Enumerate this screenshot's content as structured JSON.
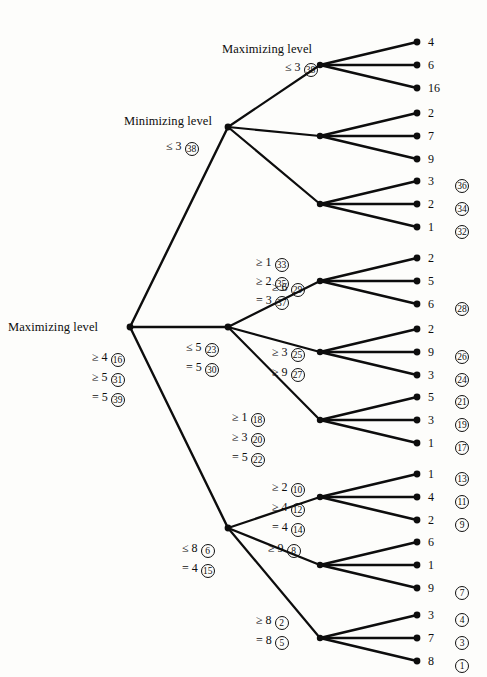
{
  "diagram": {
    "type": "alpha-beta-game-tree",
    "title": "",
    "level_labels": [
      {
        "text": "Maximizing level",
        "x": 222,
        "y": 49,
        "for_node": "root"
      },
      {
        "text": "Minimizing level",
        "x": 124,
        "y": 121,
        "for_node": "n-0"
      },
      {
        "text": "Maximizing level",
        "x": 217,
        "y": 51,
        "for_node": "n-0-0"
      }
    ],
    "root_label": "Maximizing level",
    "min_label": "Minimizing level",
    "max_label": "Maximizing level",
    "geometry": {
      "root_x": 130,
      "root_y": 327,
      "depth1_x": 228,
      "depth2_x": 320,
      "leaf_x": 417,
      "depth1_y": [
        127,
        327,
        528
      ],
      "depth2_y": [
        65,
        136,
        204,
        281,
        352,
        420,
        497,
        565,
        638
      ],
      "leaf_y": [
        42,
        65,
        88,
        113,
        136,
        159,
        181,
        204,
        227,
        258,
        281,
        304,
        329,
        352,
        375,
        397,
        420,
        443,
        474,
        497,
        520,
        542,
        565,
        588,
        615,
        638,
        661
      ]
    },
    "leaves": [
      {
        "value": "4",
        "order": "",
        "y": 42
      },
      {
        "value": "6",
        "order": "",
        "y": 65
      },
      {
        "value": "16",
        "order": "",
        "y": 88
      },
      {
        "value": "2",
        "order": "",
        "y": 113
      },
      {
        "value": "7",
        "order": "",
        "y": 136
      },
      {
        "value": "9",
        "order": "",
        "y": 159
      },
      {
        "value": "3",
        "order": "36",
        "y": 181
      },
      {
        "value": "2",
        "order": "34",
        "y": 204
      },
      {
        "value": "1",
        "order": "32",
        "y": 227
      },
      {
        "value": "2",
        "order": "",
        "y": 258
      },
      {
        "value": "5",
        "order": "",
        "y": 281
      },
      {
        "value": "6",
        "order": "28",
        "y": 304
      },
      {
        "value": "2",
        "order": "",
        "y": 329
      },
      {
        "value": "9",
        "order": "26",
        "y": 352
      },
      {
        "value": "3",
        "order": "24",
        "y": 375
      },
      {
        "value": "5",
        "order": "21",
        "y": 397
      },
      {
        "value": "3",
        "order": "19",
        "y": 420
      },
      {
        "value": "1",
        "order": "17",
        "y": 443
      },
      {
        "value": "1",
        "order": "13",
        "y": 474
      },
      {
        "value": "4",
        "order": "11",
        "y": 497
      },
      {
        "value": "2",
        "order": "9",
        "y": 520
      },
      {
        "value": "6",
        "order": "",
        "y": 542
      },
      {
        "value": "1",
        "order": "",
        "y": 565
      },
      {
        "value": "9",
        "order": "7",
        "y": 588
      },
      {
        "value": "3",
        "order": "4",
        "y": 615
      },
      {
        "value": "7",
        "order": "3",
        "y": 638
      },
      {
        "value": "8",
        "order": "1",
        "y": 661
      }
    ],
    "annotations": [
      {
        "id": "a-38b",
        "rel": "≤ 3",
        "value": "",
        "order": "38",
        "x": 285,
        "y": 67,
        "node": "n-0-0"
      },
      {
        "id": "a-38a",
        "rel": "≤ 3",
        "value": "",
        "order": "38",
        "x": 166,
        "y": 146,
        "node": "n-0"
      },
      {
        "id": "a-33",
        "rel": "≥ 1",
        "value": "",
        "order": "33",
        "x": 256,
        "y": 262,
        "node": "n-0-2"
      },
      {
        "id": "a-35",
        "rel": "≥ 2",
        "value": "",
        "order": "35",
        "x": 256,
        "y": 281,
        "node": "n-0-2"
      },
      {
        "id": "a-37",
        "rel": "= 3",
        "value": "",
        "order": "37",
        "x": 256,
        "y": 300,
        "node": "n-0-2"
      },
      {
        "id": "a-29",
        "rel": "≥ 6",
        "value": "",
        "order": "29",
        "x": 272,
        "y": 287,
        "node": "n-1-0"
      },
      {
        "id": "a-16",
        "rel": "≥ 4",
        "value": "",
        "order": "16",
        "x": 92,
        "y": 357,
        "node": "root"
      },
      {
        "id": "a-31",
        "rel": "≥ 5",
        "value": "",
        "order": "31",
        "x": 92,
        "y": 377,
        "node": "root"
      },
      {
        "id": "a-39",
        "rel": "= 5",
        "value": "",
        "order": "39",
        "x": 92,
        "y": 397,
        "node": "root"
      },
      {
        "id": "a-23",
        "rel": "≤ 5",
        "value": "",
        "order": "23",
        "x": 186,
        "y": 347,
        "node": "n-1"
      },
      {
        "id": "a-30",
        "rel": "= 5",
        "value": "",
        "order": "30",
        "x": 186,
        "y": 367,
        "node": "n-1"
      },
      {
        "id": "a-25",
        "rel": "≥ 3",
        "value": "",
        "order": "25",
        "x": 272,
        "y": 352,
        "node": "n-1-1"
      },
      {
        "id": "a-27",
        "rel": "≥ 9",
        "value": "",
        "order": "27",
        "x": 272,
        "y": 372,
        "node": "n-1-1"
      },
      {
        "id": "a-18",
        "rel": "≥ 1",
        "value": "",
        "order": "18",
        "x": 232,
        "y": 417,
        "node": "n-1-2"
      },
      {
        "id": "a-20",
        "rel": "≥ 3",
        "value": "",
        "order": "20",
        "x": 232,
        "y": 437,
        "node": "n-1-2"
      },
      {
        "id": "a-22",
        "rel": "= 5",
        "value": "",
        "order": "22",
        "x": 232,
        "y": 457,
        "node": "n-1-2"
      },
      {
        "id": "a-10",
        "rel": "≥ 2",
        "value": "",
        "order": "10",
        "x": 272,
        "y": 487,
        "node": "n-2-0"
      },
      {
        "id": "a-12",
        "rel": "≥ 4",
        "value": "",
        "order": "12",
        "x": 272,
        "y": 507,
        "node": "n-2-0"
      },
      {
        "id": "a-14",
        "rel": "= 4",
        "value": "",
        "order": "14",
        "x": 272,
        "y": 527,
        "node": "n-2-0"
      },
      {
        "id": "a-6",
        "rel": "≤ 8",
        "value": "",
        "order": "6",
        "x": 182,
        "y": 548,
        "node": "n-2"
      },
      {
        "id": "a-15",
        "rel": "= 4",
        "value": "",
        "order": "15",
        "x": 182,
        "y": 568,
        "node": "n-2"
      },
      {
        "id": "a-8",
        "rel": "≥ 9",
        "value": "",
        "order": "8",
        "x": 268,
        "y": 548,
        "node": "n-2-1"
      },
      {
        "id": "a-2",
        "rel": "≥ 8",
        "value": "",
        "order": "2",
        "x": 256,
        "y": 620,
        "node": "n-2-2"
      },
      {
        "id": "a-5",
        "rel": "= 8",
        "value": "",
        "order": "5",
        "x": 256,
        "y": 640,
        "node": "n-2-2"
      }
    ]
  }
}
